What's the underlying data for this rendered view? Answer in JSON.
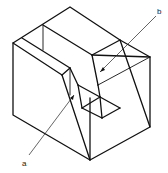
{
  "diagram": {
    "type": "isometric-sketch",
    "labels": [
      {
        "id": "a",
        "text": "a",
        "x": 24,
        "y": 165
      },
      {
        "id": "b",
        "text": "b",
        "x": 159,
        "y": 14
      }
    ],
    "colors": {
      "line": "#111111",
      "background": "#ffffff"
    }
  }
}
